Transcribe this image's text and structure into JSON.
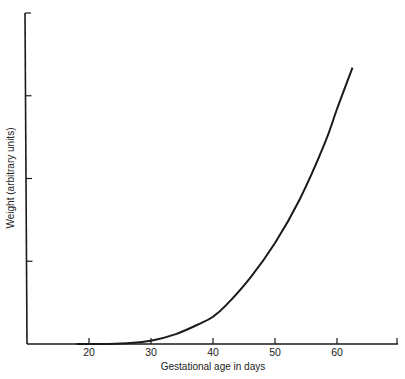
{
  "chart_data": {
    "type": "line",
    "title": "",
    "xlabel": "Gestational age in days",
    "ylabel": "Weight (arbitrary units)",
    "xlim": [
      10,
      70
    ],
    "ylim": [
      0,
      4
    ],
    "x_ticks": [
      20,
      30,
      40,
      50,
      60
    ],
    "x_tick_labels": [
      "20",
      "30",
      "40",
      "50",
      "60"
    ],
    "y_ticks": [
      1,
      2,
      3,
      4
    ],
    "y_tick_labels": [
      "",
      "",
      "",
      ""
    ],
    "grid": false,
    "legend": null,
    "series": [
      {
        "name": "Weight",
        "x": [
          18,
          22,
          26,
          30,
          34,
          38,
          40,
          42,
          46,
          50,
          54,
          58,
          60,
          62.5
        ],
        "values": [
          0.0,
          0.0,
          0.01,
          0.04,
          0.12,
          0.25,
          0.33,
          0.46,
          0.8,
          1.22,
          1.75,
          2.42,
          2.84,
          3.34
        ]
      }
    ]
  },
  "labels": {
    "xlabel": "Gestational age in days",
    "ylabel": "Weight (arbitrary units)",
    "x_ticks": [
      "20",
      "30",
      "40",
      "50",
      "60"
    ]
  },
  "colors": {
    "line": "#1a1a1a",
    "axis": "#1a1a1a",
    "background": "#ffffff"
  }
}
